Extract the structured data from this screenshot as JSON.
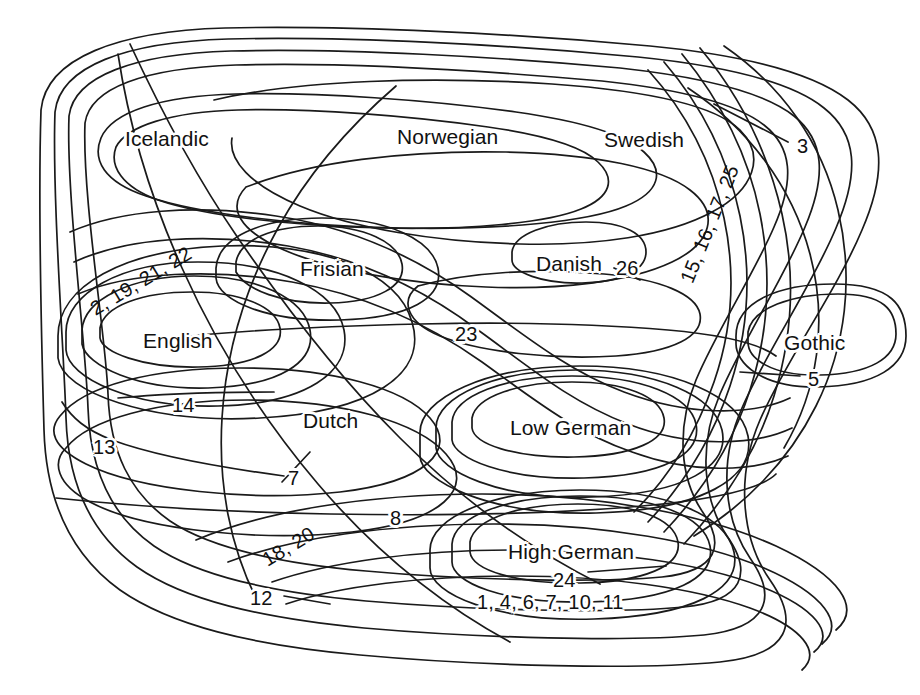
{
  "figure": {
    "type": "euler-diagram",
    "background_color": "#ffffff",
    "line_color": "#1a1a1a",
    "text_color": "#111111"
  },
  "language_labels": [
    {
      "id": "icelandic",
      "text": "Icelandic",
      "x": 125,
      "y": 128
    },
    {
      "id": "norwegian",
      "text": "Norwegian",
      "x": 397,
      "y": 126
    },
    {
      "id": "swedish",
      "text": "Swedish",
      "x": 604,
      "y": 129
    },
    {
      "id": "frisian",
      "text": "Frisian",
      "x": 300,
      "y": 258
    },
    {
      "id": "danish",
      "text": "Danish",
      "x": 536,
      "y": 253
    },
    {
      "id": "gothic",
      "text": "Gothic",
      "x": 784,
      "y": 332
    },
    {
      "id": "english",
      "text": "English",
      "x": 143,
      "y": 330
    },
    {
      "id": "dutch",
      "text": "Dutch",
      "x": 303,
      "y": 410
    },
    {
      "id": "low-german",
      "text": "Low German",
      "x": 510,
      "y": 417
    },
    {
      "id": "high-german",
      "text": "High German",
      "x": 508,
      "y": 541
    }
  ],
  "number_labels": [
    {
      "id": "n-2-19-21-22",
      "text": "2, 19, 21, 22",
      "x": 92,
      "y": 300,
      "rotation": -31
    },
    {
      "id": "n-15-16-17-25",
      "text": "15, 16, 17, 25",
      "x": 686,
      "y": 272,
      "rotation": -68
    },
    {
      "id": "n-3",
      "text": "3",
      "x": 797,
      "y": 136,
      "rotation": 0
    },
    {
      "id": "n-26",
      "text": "26",
      "x": 616,
      "y": 258,
      "rotation": 0
    },
    {
      "id": "n-23",
      "text": "23",
      "x": 455,
      "y": 324,
      "rotation": 0
    },
    {
      "id": "n-5",
      "text": "5",
      "x": 808,
      "y": 369,
      "rotation": 0
    },
    {
      "id": "n-14",
      "text": "14",
      "x": 172,
      "y": 395,
      "rotation": 0
    },
    {
      "id": "n-13",
      "text": "13",
      "x": 93,
      "y": 437,
      "rotation": 0
    },
    {
      "id": "n-7",
      "text": "7",
      "x": 288,
      "y": 468,
      "rotation": 0
    },
    {
      "id": "n-8",
      "text": "8",
      "x": 390,
      "y": 508,
      "rotation": 0
    },
    {
      "id": "n-18-20",
      "text": "18, 20",
      "x": 264,
      "y": 551,
      "rotation": -31
    },
    {
      "id": "n-12",
      "text": "12",
      "x": 250,
      "y": 588,
      "rotation": 0
    },
    {
      "id": "n-24",
      "text": "24",
      "x": 553,
      "y": 570,
      "rotation": 0
    },
    {
      "id": "n-1-4-6-7-10-11",
      "text": "1, 4, 6, 7, 10, 11",
      "x": 477,
      "y": 592,
      "rotation": 0
    }
  ],
  "isogloss_numbers": [
    1,
    2,
    3,
    4,
    5,
    6,
    7,
    8,
    10,
    11,
    12,
    13,
    14,
    15,
    16,
    17,
    18,
    19,
    20,
    21,
    22,
    23,
    24,
    25,
    26
  ],
  "curves": {
    "count": 26,
    "style": "closed smooth contour lines, unfilled"
  }
}
